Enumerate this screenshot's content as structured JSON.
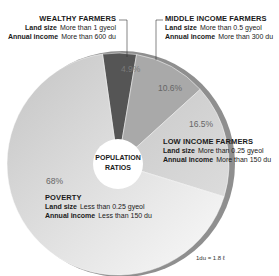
{
  "chart_data": {
    "type": "pie",
    "title": "POPULATION RATIOS",
    "categories": [
      "Wealthy Farmers",
      "Middle Income Farmers",
      "Low Income Farmers",
      "Poverty"
    ],
    "values": [
      4.9,
      10.6,
      16.5,
      68
    ],
    "unit": "%",
    "colors": [
      "#555555",
      "#a9a9a9",
      "#cfcfcf",
      "#d4d4d4"
    ],
    "donut_hole": true,
    "legend_position": "callouts",
    "annotations": [
      "1du = 1.8 ℓ"
    ]
  },
  "center": {
    "line1": "POPULATION",
    "line2": "RATIOS"
  },
  "slices": [
    {
      "name": "WEALTHY FARMERS",
      "pct": "4.9%",
      "land_label": "Land size",
      "land_value": "More than 1 gyeol",
      "income_label": "Annual income",
      "income_value": "More than 600 du"
    },
    {
      "name": "MIDDLE INCOME FARMERS",
      "pct": "10.6%",
      "land_label": "Land size",
      "land_value": "More than 0.5 gyeol",
      "income_label": "Annual income",
      "income_value": "More than 300 du"
    },
    {
      "name": "LOW INCOME FARMERS",
      "pct": "16.5%",
      "land_label": "Land size",
      "land_value": "More than 0.25 gyeol",
      "income_label": "Annual income",
      "income_value": "More than 150 du"
    },
    {
      "name": "POVERTY",
      "pct": "68%",
      "land_label": "Land size",
      "land_value": "Less than 0.25 gyeol",
      "income_label": "Annual income",
      "income_value": "Less than 150 du"
    }
  ],
  "footnote": "1du = 1.8 ℓ"
}
